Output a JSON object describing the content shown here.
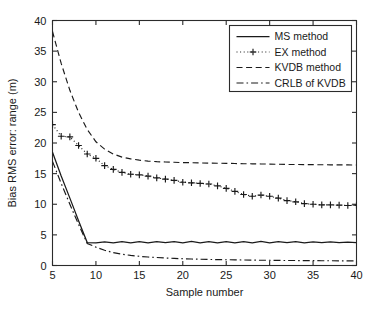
{
  "chart_data": {
    "type": "line",
    "title": "",
    "xlabel": "Sample number",
    "ylabel": "Bias RMS error: range (m)",
    "xlim": [
      5,
      40
    ],
    "ylim": [
      0,
      40
    ],
    "xticks": [
      5,
      10,
      15,
      20,
      25,
      30,
      35,
      40
    ],
    "yticks": [
      0,
      5,
      10,
      15,
      20,
      25,
      30,
      35,
      40
    ],
    "xtick_labels": [
      "5",
      "10",
      "15",
      "20",
      "25",
      "30",
      "35",
      "40"
    ],
    "ytick_labels": [
      "0",
      "5",
      "10",
      "15",
      "20",
      "25",
      "30",
      "35",
      "40"
    ],
    "grid": false,
    "legend_position": "upper right",
    "x": [
      5,
      6,
      7,
      8,
      9,
      10,
      11,
      12,
      13,
      14,
      15,
      16,
      17,
      18,
      19,
      20,
      21,
      22,
      23,
      24,
      25,
      26,
      27,
      28,
      29,
      30,
      31,
      32,
      33,
      34,
      35,
      36,
      37,
      38,
      39,
      40
    ],
    "series": [
      {
        "name": "MS method",
        "style": "solid",
        "marker": "none",
        "values": [
          18.5,
          14.6,
          11.0,
          7.3,
          3.75,
          3.7,
          3.85,
          3.7,
          3.9,
          3.7,
          3.9,
          3.7,
          3.9,
          3.72,
          3.9,
          3.7,
          3.92,
          3.7,
          3.9,
          3.7,
          3.9,
          3.7,
          3.9,
          3.7,
          3.92,
          3.7,
          3.9,
          3.72,
          3.88,
          3.7,
          3.85,
          3.72,
          3.85,
          3.72,
          3.82,
          3.75
        ]
      },
      {
        "name": "EX method",
        "style": "dotted",
        "marker": "plus",
        "values": [
          23.0,
          21.1,
          21.0,
          19.6,
          18.2,
          17.5,
          16.3,
          15.7,
          15.2,
          14.9,
          14.8,
          14.6,
          14.3,
          14.1,
          13.9,
          13.6,
          13.5,
          13.4,
          13.3,
          13.0,
          12.6,
          12.1,
          11.6,
          11.3,
          11.5,
          11.3,
          11.0,
          10.6,
          10.4,
          10.1,
          10.0,
          9.9,
          9.9,
          9.85,
          9.8,
          9.85
        ]
      },
      {
        "name": "KVDB method",
        "style": "dashed",
        "marker": "none",
        "values": [
          38.2,
          33.0,
          28.6,
          25.0,
          22.2,
          20.2,
          19.0,
          18.2,
          17.7,
          17.4,
          17.2,
          17.05,
          16.95,
          16.9,
          16.85,
          16.8,
          16.78,
          16.75,
          16.72,
          16.7,
          16.68,
          16.65,
          16.62,
          16.6,
          16.58,
          16.55,
          16.53,
          16.5,
          16.49,
          16.47,
          16.46,
          16.45,
          16.44,
          16.43,
          16.42,
          16.4
        ]
      },
      {
        "name": "CRLB of KVDB",
        "style": "dashdot",
        "marker": "none",
        "values": [
          17.0,
          13.4,
          10.0,
          6.7,
          3.6,
          3.0,
          2.5,
          2.1,
          1.85,
          1.65,
          1.5,
          1.38,
          1.3,
          1.22,
          1.16,
          1.1,
          1.06,
          1.02,
          0.99,
          0.96,
          0.94,
          0.92,
          0.9,
          0.88,
          0.86,
          0.85,
          0.83,
          0.82,
          0.81,
          0.8,
          0.79,
          0.78,
          0.77,
          0.76,
          0.75,
          0.74
        ]
      }
    ],
    "colors": {
      "axis": "#2b2b2b",
      "line": "#1a1a1a",
      "background": "#ffffff"
    }
  },
  "legend": {
    "entries": [
      {
        "label": "MS method",
        "style": "solid"
      },
      {
        "label": "EX method",
        "style": "dotted-plus"
      },
      {
        "label": "KVDB method",
        "style": "dashed"
      },
      {
        "label": "CRLB of KVDB",
        "style": "dashdot"
      }
    ]
  }
}
